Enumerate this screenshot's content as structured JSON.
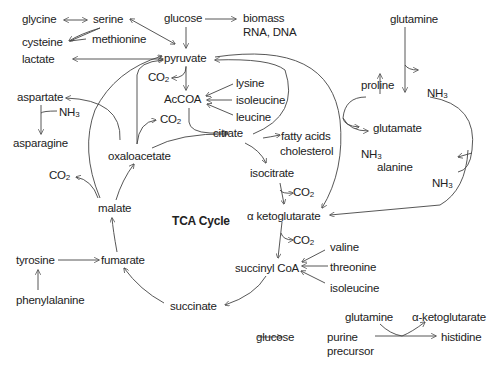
{
  "diagram": {
    "title": "TCA Cycle",
    "colors": {
      "text": "#222222",
      "lines": "#444444",
      "background": "#ffffff"
    },
    "nodes": {
      "glycine": "glycine",
      "serine": "serine",
      "cysteine": "cysteine",
      "methionine": "methionine",
      "lactate": "lactate",
      "glucose_top": "glucose",
      "biomass": "biomass",
      "rna_dna": "RNA, DNA",
      "pyruvate": "pyruvate",
      "co2_pyruvate": "CO",
      "accoa": "AcCOA",
      "lysine": "lysine",
      "isoleucine_accoa": "isoleucine",
      "leucine": "leucine",
      "aspartate": "aspartate",
      "nh3_aspartate": "NH",
      "asparagine": "asparagine",
      "co2_oaa": "CO",
      "oxaloacetate": "oxaloacetate",
      "citrate": "citrate",
      "fatty_acids": "fatty acids",
      "cholesterol": "cholesterol",
      "co2_malate": "CO",
      "malate": "malate",
      "isocitrate": "isocitrate",
      "co2_isocitrate": "CO",
      "alpha_ketoglutarate": "α ketoglutarate",
      "co2_akg": "CO",
      "glutamine_top": "glutamine",
      "proline": "proline",
      "nh3_glutamine": "NH",
      "glutamate": "glutamate",
      "nh3_glutamate": "NH",
      "alanine": "alanine",
      "nh3_right": "NH",
      "tyrosine": "tyrosine",
      "phenylalanine": "phenylalanine",
      "fumarate": "fumarate",
      "succinyl_coa": "succinyl CoA",
      "valine": "valine",
      "threonine": "threonine",
      "isoleucine_succ": "isoleucine",
      "succinate": "succinate",
      "glucose_bottom": "glucose",
      "purine": "purine",
      "precursor": "precursor",
      "glutamine_bottom": "glutamine",
      "alpha_kg_bottom": "α-ketoglutarate",
      "histidine": "histidine"
    },
    "subscripts": {
      "co2": "2",
      "nh3": "3"
    },
    "edges": [
      {
        "from": "glycine",
        "to": "serine",
        "type": "bidirectional"
      },
      {
        "from": "methionine",
        "to": "cysteine"
      },
      {
        "from": "serine",
        "to": "pyruvate",
        "type": "bidirectional"
      },
      {
        "from": "glucose",
        "to": "biomass / RNA, DNA"
      },
      {
        "from": "glucose",
        "to": "pyruvate"
      },
      {
        "from": "pyruvate",
        "to": "lactate",
        "type": "bidirectional"
      },
      {
        "from": "pyruvate",
        "to": "CO2"
      },
      {
        "from": "pyruvate",
        "to": "AcCOA"
      },
      {
        "from": "lysine",
        "to": "AcCOA"
      },
      {
        "from": "isoleucine",
        "to": "AcCOA"
      },
      {
        "from": "leucine",
        "to": "AcCOA"
      },
      {
        "from": "AcCOA",
        "to": "citrate"
      },
      {
        "from": "oxaloacetate",
        "to": "citrate"
      },
      {
        "from": "oxaloacetate",
        "to": "CO2"
      },
      {
        "from": "oxaloacetate",
        "to": "pyruvate"
      },
      {
        "from": "oxaloacetate",
        "to": "aspartate"
      },
      {
        "from": "aspartate",
        "to": "asparagine",
        "byproduct": "NH3"
      },
      {
        "from": "citrate",
        "to": "fatty acids / cholesterol"
      },
      {
        "from": "citrate",
        "to": "pyruvate"
      },
      {
        "from": "citrate",
        "to": "isocitrate"
      },
      {
        "from": "isocitrate",
        "to": "α ketoglutarate",
        "byproduct": "CO2"
      },
      {
        "from": "pyruvate",
        "to": "α ketoglutarate"
      },
      {
        "from": "glutamine",
        "to": "glutamate",
        "byproduct": "NH3"
      },
      {
        "from": "glutamate",
        "to": "proline"
      },
      {
        "from": "glutamate",
        "to": "alanine",
        "byproduct": "NH3"
      },
      {
        "from": "glutamate",
        "to": "α ketoglutarate",
        "byproduct": "NH3"
      },
      {
        "from": "α ketoglutarate",
        "to": "succinyl CoA",
        "byproduct": "CO2"
      },
      {
        "from": "valine",
        "to": "succinyl CoA"
      },
      {
        "from": "threonine",
        "to": "succinyl CoA"
      },
      {
        "from": "isoleucine",
        "to": "succinyl CoA"
      },
      {
        "from": "succinyl CoA",
        "to": "succinate"
      },
      {
        "from": "succinate",
        "to": "fumarate"
      },
      {
        "from": "phenylalanine",
        "to": "tyrosine"
      },
      {
        "from": "tyrosine",
        "to": "fumarate"
      },
      {
        "from": "fumarate",
        "to": "malate"
      },
      {
        "from": "malate",
        "to": "oxaloacetate"
      },
      {
        "from": "malate",
        "to": "CO2"
      },
      {
        "from": "malate",
        "to": "pyruvate"
      },
      {
        "from": "glucose",
        "to": "purine precursor"
      },
      {
        "from": "purine precursor",
        "to": "histidine",
        "cofactor_in": "glutamine",
        "cofactor_out": "α-ketoglutarate"
      }
    ]
  }
}
